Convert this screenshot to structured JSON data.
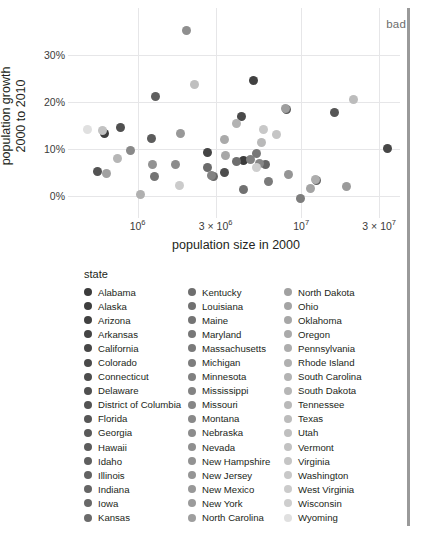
{
  "annotation": {
    "label": "bad"
  },
  "legend": {
    "title": "state"
  },
  "chart_data": {
    "type": "scatter",
    "title": "",
    "xlabel": "population size in 2000",
    "ylabel": "population growth\n2000 to 2010",
    "ylabel_line1": "population growth",
    "ylabel_line2": "2000 to 2010",
    "xscale": "log",
    "yscale": "linear",
    "grid": true,
    "legend_position": "bottom",
    "legend_title": "state",
    "xlim": [
      420000,
      38000000
    ],
    "ylim": [
      -0.03,
      0.37
    ],
    "xticks": [
      {
        "value": 1000000,
        "label": "10⁶",
        "mantissa": "10",
        "exponent": "6"
      },
      {
        "value": 3000000,
        "label": "3 × 10⁶",
        "mantissa": "3 × 10",
        "exponent": "6"
      },
      {
        "value": 10000000,
        "label": "10⁷",
        "mantissa": "10",
        "exponent": "7"
      },
      {
        "value": 30000000,
        "label": "3 × 10⁷",
        "mantissa": "3 × 10",
        "exponent": "7"
      }
    ],
    "yticks": [
      {
        "value": 0.0,
        "label": "0%"
      },
      {
        "value": 0.1,
        "label": "10%"
      },
      {
        "value": 0.2,
        "label": "20%"
      },
      {
        "value": 0.3,
        "label": "30%"
      }
    ],
    "color_scale": {
      "type": "grayscale-sequential",
      "from": "#3a3a3a",
      "to": "#ececec"
    },
    "points": [
      {
        "state": "Alabama",
        "pop2000": 4447100,
        "growth": 0.075,
        "color": "#3b3b3b"
      },
      {
        "state": "Alaska",
        "pop2000": 626932,
        "growth": 0.132,
        "color": "#3e3e3e"
      },
      {
        "state": "Arizona",
        "pop2000": 5130632,
        "growth": 0.245,
        "color": "#414141"
      },
      {
        "state": "Arkansas",
        "pop2000": 2673400,
        "growth": 0.092,
        "color": "#444444"
      },
      {
        "state": "California",
        "pop2000": 33871648,
        "growth": 0.1,
        "color": "#474747"
      },
      {
        "state": "Colorado",
        "pop2000": 4301261,
        "growth": 0.169,
        "color": "#4a4a4a"
      },
      {
        "state": "Connecticut",
        "pop2000": 3405565,
        "growth": 0.049,
        "color": "#4d4d4d"
      },
      {
        "state": "Delaware",
        "pop2000": 783600,
        "growth": 0.145,
        "color": "#505050"
      },
      {
        "state": "District of Columbia",
        "pop2000": 572059,
        "growth": 0.052,
        "color": "#535353"
      },
      {
        "state": "Florida",
        "pop2000": 15982378,
        "growth": 0.178,
        "color": "#565656"
      },
      {
        "state": "Georgia",
        "pop2000": 8186453,
        "growth": 0.184,
        "color": "#595959"
      },
      {
        "state": "Hawaii",
        "pop2000": 1211537,
        "growth": 0.122,
        "color": "#5c5c5c"
      },
      {
        "state": "Idaho",
        "pop2000": 1293953,
        "growth": 0.212,
        "color": "#5f5f5f"
      },
      {
        "state": "Illinois",
        "pop2000": 12419293,
        "growth": 0.033,
        "color": "#626262"
      },
      {
        "state": "Indiana",
        "pop2000": 6080485,
        "growth": 0.067,
        "color": "#656565"
      },
      {
        "state": "Iowa",
        "pop2000": 2926324,
        "growth": 0.041,
        "color": "#686868"
      },
      {
        "state": "Kansas",
        "pop2000": 2688418,
        "growth": 0.06,
        "color": "#6b6b6b"
      },
      {
        "state": "Kentucky",
        "pop2000": 4041769,
        "growth": 0.073,
        "color": "#6e6e6e"
      },
      {
        "state": "Louisiana",
        "pop2000": 4468976,
        "growth": 0.014,
        "color": "#717171"
      },
      {
        "state": "Maine",
        "pop2000": 1274923,
        "growth": 0.042,
        "color": "#747474"
      },
      {
        "state": "Maryland",
        "pop2000": 5296486,
        "growth": 0.09,
        "color": "#777777"
      },
      {
        "state": "Massachusetts",
        "pop2000": 6349097,
        "growth": 0.031,
        "color": "#7a7a7a"
      },
      {
        "state": "Michigan",
        "pop2000": 9938444,
        "growth": -0.006,
        "color": "#7d7d7d"
      },
      {
        "state": "Minnesota",
        "pop2000": 4919479,
        "growth": 0.077,
        "color": "#808080"
      },
      {
        "state": "Mississippi",
        "pop2000": 2844658,
        "growth": 0.043,
        "color": "#838383"
      },
      {
        "state": "Missouri",
        "pop2000": 5595211,
        "growth": 0.07,
        "color": "#868686"
      },
      {
        "state": "Montana",
        "pop2000": 902195,
        "growth": 0.097,
        "color": "#898989"
      },
      {
        "state": "Nebraska",
        "pop2000": 1711263,
        "growth": 0.067,
        "color": "#8c8c8c"
      },
      {
        "state": "Nevada",
        "pop2000": 1998257,
        "growth": 0.352,
        "color": "#8f8f8f"
      },
      {
        "state": "New Hampshire",
        "pop2000": 1235786,
        "growth": 0.066,
        "color": "#929292"
      },
      {
        "state": "New Jersey",
        "pop2000": 8414350,
        "growth": 0.045,
        "color": "#959595"
      },
      {
        "state": "New Mexico",
        "pop2000": 1819046,
        "growth": 0.132,
        "color": "#989898"
      },
      {
        "state": "New York",
        "pop2000": 18976457,
        "growth": 0.021,
        "color": "#9b9b9b"
      },
      {
        "state": "North Carolina",
        "pop2000": 8049313,
        "growth": 0.185,
        "color": "#9e9e9e"
      },
      {
        "state": "North Dakota",
        "pop2000": 642200,
        "growth": 0.047,
        "color": "#a1a1a1"
      },
      {
        "state": "Ohio",
        "pop2000": 11353140,
        "growth": 0.016,
        "color": "#a4a4a4"
      },
      {
        "state": "Oklahoma",
        "pop2000": 3450654,
        "growth": 0.086,
        "color": "#a7a7a7"
      },
      {
        "state": "Oregon",
        "pop2000": 3421399,
        "growth": 0.12,
        "color": "#aaaaaa"
      },
      {
        "state": "Pennsylvania",
        "pop2000": 12281054,
        "growth": 0.034,
        "color": "#adadad"
      },
      {
        "state": "Rhode Island",
        "pop2000": 1048319,
        "growth": 0.004,
        "color": "#b0b0b0"
      },
      {
        "state": "South Carolina",
        "pop2000": 4012012,
        "growth": 0.153,
        "color": "#b3b3b3"
      },
      {
        "state": "South Dakota",
        "pop2000": 754844,
        "growth": 0.079,
        "color": "#b6b6b6"
      },
      {
        "state": "Tennessee",
        "pop2000": 5689283,
        "growth": 0.114,
        "color": "#b9b9b9"
      },
      {
        "state": "Texas",
        "pop2000": 20851820,
        "growth": 0.206,
        "color": "#bcbcbc"
      },
      {
        "state": "Utah",
        "pop2000": 2233169,
        "growth": 0.237,
        "color": "#bfbfbf"
      },
      {
        "state": "Vermont",
        "pop2000": 608827,
        "growth": 0.14,
        "color": "#c2c2c2"
      },
      {
        "state": "Virginia",
        "pop2000": 7078515,
        "growth": 0.13,
        "color": "#c5c5c5"
      },
      {
        "state": "Washington",
        "pop2000": 5894121,
        "growth": 0.142,
        "color": "#c8c8c8"
      },
      {
        "state": "West Virginia",
        "pop2000": 1808344,
        "growth": 0.023,
        "color": "#cbcbcb"
      },
      {
        "state": "Wisconsin",
        "pop2000": 5363675,
        "growth": 0.06,
        "color": "#cecece"
      },
      {
        "state": "Wyoming",
        "pop2000": 493782,
        "growth": 0.141,
        "color": "#e0e0e0"
      }
    ]
  }
}
